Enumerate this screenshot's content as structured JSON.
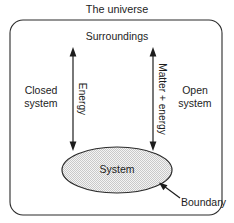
{
  "diagram": {
    "title": "The universe",
    "surroundings_label": "Surroundings",
    "system_label": "System",
    "boundary_label": "Boundary",
    "closed_system_line1": "Closed",
    "closed_system_line2": "system",
    "open_system_line1": "Open",
    "open_system_line2": "system",
    "energy_arrow_label": "Energy",
    "matter_energy_arrow_label": "Matter + energy"
  },
  "colors": {
    "background": "#ffffff",
    "line": "#2b2b2b",
    "text": "#1d1d1d",
    "fill_pattern": "#b8b8b8",
    "ellipse_fill_base": "#f2f2f2"
  },
  "geometry": {
    "outer_box": {
      "x": 10,
      "y": 20,
      "width": 212,
      "height": 195,
      "radius": 13
    },
    "ellipse": {
      "cx": 117,
      "cy": 170,
      "rx": 55,
      "ry": 23
    },
    "left_arrow_x": 73,
    "right_arrow_x": 153,
    "arrow_top_y": 50,
    "arrow_bottom_y": 148
  }
}
